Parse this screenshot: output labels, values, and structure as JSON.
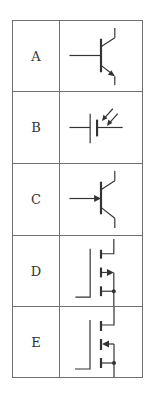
{
  "table": {
    "rows": [
      {
        "label": "A",
        "symbol": "npn-bipolar-transistor-icon"
      },
      {
        "label": "B",
        "symbol": "photo-cell-battery-icon"
      },
      {
        "label": "C",
        "symbol": "transistor-base-arrow-icon"
      },
      {
        "label": "D",
        "symbol": "mosfet-arrow-in-icon"
      },
      {
        "label": "E",
        "symbol": "mosfet-arrow-out-icon"
      }
    ]
  },
  "colors": {
    "line": "#333333",
    "border": "#707070",
    "background": "#ffffff"
  }
}
